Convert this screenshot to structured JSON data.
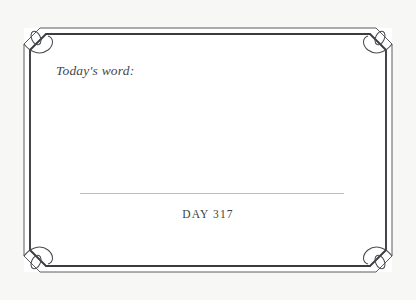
{
  "card": {
    "prompt_label": "Today's word:",
    "day_counter": "DAY 317",
    "entry_value": "",
    "entry_placeholder": ""
  },
  "colors": {
    "page_background": "#f7f7f6",
    "card_background": "#ffffff",
    "border_outer": "#5a5c60",
    "border_inner": "#3a3c40",
    "ornament": "#4a4c50",
    "rule": "#b9bbbd",
    "prompt_text": "#45474a",
    "day_text": "#3d3f42"
  },
  "layout": {
    "rule_left": 80,
    "rule_right": 344,
    "rule_y": 193
  }
}
